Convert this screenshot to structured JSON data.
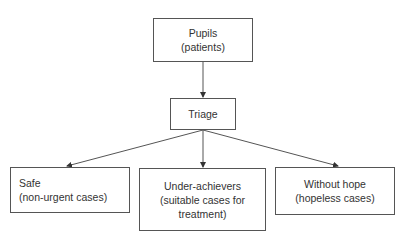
{
  "diagram": {
    "nodes": {
      "pupils": {
        "line1": "Pupils",
        "line2": "(patients)"
      },
      "triage": {
        "line1": "Triage"
      },
      "safe": {
        "line1": "Safe",
        "line2": "(non-urgent cases)"
      },
      "under": {
        "line1": "Under-achievers",
        "line2": "(suitable cases for",
        "line3": "treatment)"
      },
      "hope": {
        "line1": "Without hope",
        "line2": "(hopeless cases)"
      }
    },
    "edges": [
      {
        "from": "pupils",
        "to": "triage"
      },
      {
        "from": "triage",
        "to": "safe"
      },
      {
        "from": "triage",
        "to": "under"
      },
      {
        "from": "triage",
        "to": "hope"
      }
    ],
    "colors": {
      "line": "#555555",
      "text": "#333333",
      "background": "#ffffff"
    }
  }
}
